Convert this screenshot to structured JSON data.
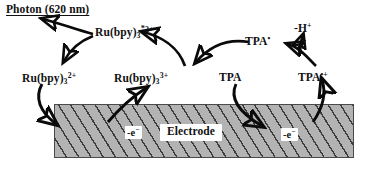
{
  "figure": {
    "kind": "ecl-mechanism-diagram",
    "background_color": "#ffffff",
    "ink_color": "#0a0a0a"
  },
  "emission": {
    "label_text": "Photon (620 nm)",
    "species": "Photon",
    "wavelength_value": "620",
    "wavelength_unit": "nm",
    "underlined": true
  },
  "species": {
    "ru_excited": {
      "base": "Ru(bpy)",
      "subscript": "3",
      "excited_marker": "*",
      "superscript": "2+",
      "name": "excited ruthenium tris-bipyridine dication"
    },
    "ru_2plus": {
      "base": "Ru(bpy)",
      "subscript": "3",
      "superscript": "2+",
      "name": "ruthenium tris-bipyridine dication"
    },
    "ru_3plus": {
      "base": "Ru(bpy)",
      "subscript": "3",
      "superscript": "3+",
      "name": "ruthenium tris-bipyridine trication"
    },
    "tpa": {
      "base": "TPA",
      "superscript": "",
      "name": "tripropylamine"
    },
    "tpa_radical_cation": {
      "base": "TPA",
      "superscript": "•+",
      "name": "TPA radical cation"
    },
    "tpa_radical": {
      "base": "TPA",
      "superscript": "•",
      "name": "TPA free radical"
    },
    "proton_loss": {
      "base": "-H",
      "superscript": "+",
      "name": "loss of a proton"
    }
  },
  "electrode": {
    "label": "Electrode",
    "fill_color": "#b3b3b3",
    "hatch_color": "#282828",
    "border_color": "#4a4a4a",
    "electron_transfer_left": {
      "base": "-e",
      "superscript": "−",
      "name": "electron removed at electrode (left)"
    },
    "electron_transfer_right": {
      "base": "-e",
      "superscript": "−",
      "name": "electron removed at electrode (right)"
    }
  },
  "arrows": [
    {
      "name": "photon-emission-arrow",
      "from": "ru_excited",
      "to": "photon",
      "style": "curved"
    },
    {
      "name": "excited-to-ground-arrow",
      "from": "ru_excited",
      "to": "ru_2plus",
      "style": "curved"
    },
    {
      "name": "ru2plus-oxidation-arrow",
      "from": "ru_2plus",
      "to": "ru_3plus",
      "style": "curved-down-to-electrode"
    },
    {
      "name": "ru3plus-to-excited-arrow",
      "from": "ru_3plus",
      "to": "ru_excited",
      "style": "curved"
    },
    {
      "name": "tpa-oxidation-arrow",
      "from": "tpa",
      "to": "tpa_radical_cation",
      "style": "curved-down-to-electrode"
    },
    {
      "name": "tpa-radical-cation-to-radical-arrow",
      "from": "tpa_radical_cation",
      "to": "tpa_radical",
      "style": "curved"
    },
    {
      "name": "deprotonation-arrow",
      "from": "tpa_radical_cation",
      "to": "proton_loss",
      "style": "curved-up"
    },
    {
      "name": "tpa-radical-to-ru3plus-arrow",
      "from": "tpa_radical",
      "to": "ru_3plus",
      "style": "curved"
    }
  ]
}
